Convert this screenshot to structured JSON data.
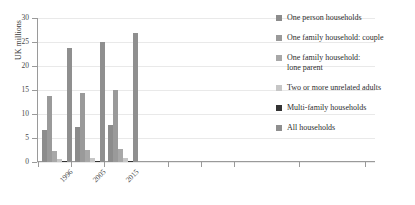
{
  "chart_data": {
    "type": "bar",
    "title": "",
    "xlabel": "",
    "ylabel": "UK millions",
    "categories": [
      "1996",
      "2005",
      "2015"
    ],
    "ylim": [
      0,
      30
    ],
    "yticks": [
      0,
      5,
      10,
      15,
      20,
      25,
      30
    ],
    "ytick_labels": [
      "0",
      "5",
      "10",
      "15",
      "20",
      "25",
      "30"
    ],
    "grid": true,
    "legend_position": "right",
    "series": [
      {
        "name": "One person households",
        "color": "#8c8c8c",
        "values": [
          6.6,
          7.2,
          7.7
        ]
      },
      {
        "name": "One family household: couple",
        "color": "#9a9a9a",
        "values": [
          13.8,
          14.4,
          14.9
        ]
      },
      {
        "name": "One family household:\nlone parent",
        "color": "#a8a8a8",
        "values": [
          2.2,
          2.6,
          2.8
        ]
      },
      {
        "name": "Two or more unrelated adults",
        "color": "#c6c6c6",
        "values": [
          0.6,
          0.8,
          0.9
        ]
      },
      {
        "name": "Multi-family households",
        "color": "#333333",
        "values": [
          0.2,
          0.2,
          0.3
        ]
      },
      {
        "name": "All households",
        "color": "#8f8f8f",
        "values": [
          23.7,
          24.9,
          26.8
        ]
      }
    ]
  },
  "axis": {
    "y_title": "UK millions"
  }
}
